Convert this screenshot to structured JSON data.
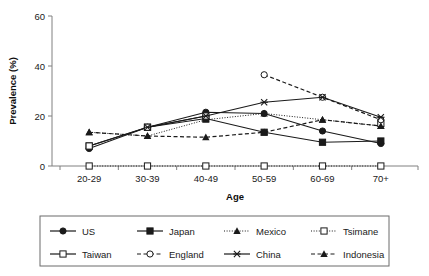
{
  "chart_data": {
    "type": "line",
    "title": "",
    "xlabel": "Age",
    "ylabel": "Prevalence (%)",
    "categories": [
      "20-29",
      "30-39",
      "40-49",
      "50-59",
      "60-69",
      "70+"
    ],
    "ylim": [
      0,
      60
    ],
    "yticks": [
      0,
      20,
      40,
      60
    ],
    "grid": false,
    "legend_position": "bottom",
    "series": [
      {
        "name": "US",
        "values": [
          7,
          15.5,
          21.5,
          21,
          14,
          9
        ],
        "style": "solid",
        "marker": "filled-circle"
      },
      {
        "name": "Japan",
        "values": [
          8,
          15.5,
          19,
          13.5,
          9.5,
          10
        ],
        "style": "solid",
        "marker": "filled-square"
      },
      {
        "name": "Mexico",
        "values": [
          13.5,
          12,
          18.5,
          21,
          18.5,
          16
        ],
        "style": "dotted",
        "marker": "filled-triangle"
      },
      {
        "name": "Tsimane",
        "values": [
          0,
          0,
          0,
          0,
          0,
          0
        ],
        "style": "dotted",
        "marker": "open-square"
      },
      {
        "name": "Taiwan",
        "values": [
          8,
          15.5,
          20,
          null,
          null,
          17
        ],
        "style": "solid",
        "marker": "open-square"
      },
      {
        "name": "England",
        "values": [
          null,
          null,
          null,
          36.5,
          27.5,
          18.5
        ],
        "style": "dashed",
        "marker": "open-circle"
      },
      {
        "name": "China",
        "values": [
          null,
          15.5,
          20,
          25.5,
          27.5,
          19.5
        ],
        "style": "solid",
        "marker": "star"
      },
      {
        "name": "Indonesia",
        "values": [
          13.5,
          12,
          11.5,
          13.5,
          18.5,
          16
        ],
        "style": "dashed",
        "marker": "filled-triangle"
      }
    ]
  },
  "axes": {
    "y_tick_labels": [
      "0",
      "20",
      "40",
      "60"
    ],
    "x_tick_labels": [
      "20-29",
      "30-39",
      "40-49",
      "50-59",
      "60-69",
      "70+"
    ],
    "y_title": "Prevalence (%)",
    "x_title": "Age"
  },
  "legend": {
    "rows": [
      [
        {
          "label": "US",
          "marker": "filled-circle",
          "style": "solid"
        },
        {
          "label": "Japan",
          "marker": "filled-square",
          "style": "solid"
        },
        {
          "label": "Mexico",
          "marker": "filled-triangle",
          "style": "dotted"
        },
        {
          "label": "Tsimane",
          "marker": "open-square",
          "style": "dotted"
        }
      ],
      [
        {
          "label": "Taiwan",
          "marker": "open-square",
          "style": "solid"
        },
        {
          "label": "England",
          "marker": "open-circle",
          "style": "dashed"
        },
        {
          "label": "China",
          "marker": "star",
          "style": "solid"
        },
        {
          "label": "Indonesia",
          "marker": "filled-triangle",
          "style": "dashed"
        }
      ]
    ]
  },
  "colors": {
    "line": "#1a1a1a",
    "axis": "#808080",
    "text": "#1a1a1a",
    "background": "#ffffff",
    "legend_border": "#6b6b6b"
  }
}
